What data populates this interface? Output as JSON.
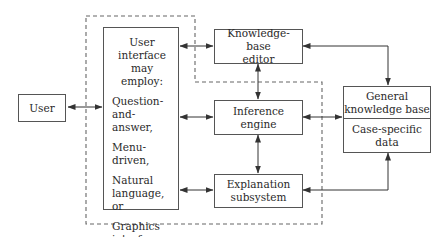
{
  "diagram": {
    "type": "expert-system-architecture",
    "nodes": {
      "user": {
        "label": "User"
      },
      "user_interface": {
        "heading": "User interface\nmay employ:",
        "styles": [
          "Question-and-\nanswer,",
          "Menu-driven,",
          "Natural\nlanguage, or",
          "Graphics\ninterface\nstyles"
        ]
      },
      "kb_editor": {
        "label": "Knowledge-base\neditor"
      },
      "inference_engine": {
        "label": "Inference engine"
      },
      "explanation": {
        "label": "Explanation\nsubsystem"
      },
      "knowledge_base": {
        "top_label": "General\nknowledge base",
        "bottom_label": "Case-specific\ndata"
      }
    },
    "edges": [
      {
        "from": "user",
        "to": "user_interface",
        "direction": "both"
      },
      {
        "from": "user_interface",
        "to": "kb_editor",
        "direction": "both"
      },
      {
        "from": "user_interface",
        "to": "inference_engine",
        "direction": "both"
      },
      {
        "from": "user_interface",
        "to": "explanation",
        "direction": "both"
      },
      {
        "from": "kb_editor",
        "to": "inference_engine",
        "direction": "both"
      },
      {
        "from": "inference_engine",
        "to": "explanation",
        "direction": "both"
      },
      {
        "from": "kb_editor",
        "to": "knowledge_base",
        "direction": "both"
      },
      {
        "from": "inference_engine",
        "to": "knowledge_base",
        "direction": "both"
      },
      {
        "from": "explanation",
        "to": "knowledge_base",
        "direction": "both"
      }
    ],
    "boundary": {
      "style": "dashed",
      "encloses": [
        "user_interface",
        "inference_engine",
        "explanation"
      ]
    },
    "colors": {
      "line": "#333333",
      "box_border": "#555555",
      "background": "#ffffff"
    }
  }
}
